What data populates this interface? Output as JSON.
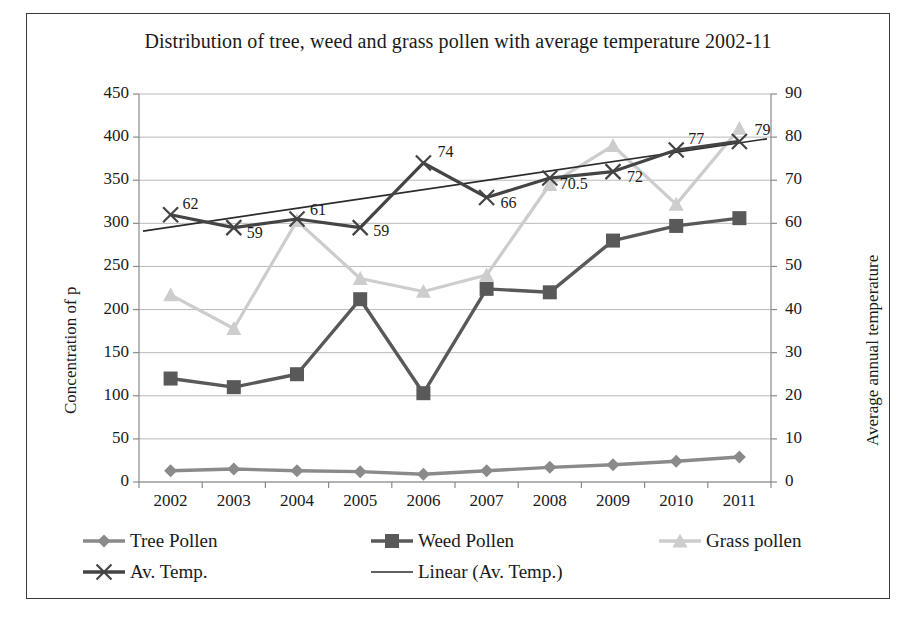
{
  "chart_data": {
    "type": "line",
    "title": "Distribution of tree, weed and grass pollen with average temperature 2002-11",
    "xlabel": "",
    "ylabel": "Concentration of p",
    "y2label": "Average annual temperature",
    "categories": [
      "2002",
      "2003",
      "2004",
      "2005",
      "2006",
      "2007",
      "2008",
      "2009",
      "2010",
      "2011"
    ],
    "ylim": [
      0,
      450
    ],
    "yticks": [
      "0",
      "50",
      "100",
      "150",
      "200",
      "250",
      "300",
      "350",
      "400",
      "450"
    ],
    "y2lim": [
      0,
      90
    ],
    "y2ticks": [
      "0",
      "10",
      "20",
      "30",
      "40",
      "50",
      "60",
      "70",
      "80",
      "90"
    ],
    "grid": true,
    "legend_position": "bottom",
    "series": [
      {
        "name": "Tree Pollen",
        "axis": "left",
        "marker": "diamond",
        "color": "#8a8a8a",
        "values": [
          13,
          15,
          13,
          12,
          9,
          13,
          17,
          20,
          24,
          29
        ]
      },
      {
        "name": "Weed Pollen",
        "axis": "left",
        "marker": "square",
        "color": "#595959",
        "values": [
          120,
          110,
          125,
          212,
          103,
          224,
          220,
          280,
          297,
          306
        ]
      },
      {
        "name": "Grass pollen",
        "axis": "left",
        "marker": "triangle",
        "color": "#cdcdcd",
        "values": [
          217,
          178,
          303,
          236,
          221,
          240,
          345,
          390,
          322,
          410
        ]
      },
      {
        "name": "Av. Temp.",
        "axis": "right",
        "marker": "x",
        "color": "#444444",
        "values": [
          62,
          59,
          61,
          59,
          74,
          66,
          70.5,
          72,
          77,
          79
        ],
        "data_labels": [
          "62",
          "59",
          "61",
          "59",
          "74",
          "66",
          "70.5",
          "72",
          "77",
          "79"
        ]
      },
      {
        "name": "Linear (Av. Temp.)",
        "axis": "right",
        "marker": "none",
        "color": "#2b2b2b",
        "trendline": true,
        "start_value": 58.2,
        "end_value": 79.6
      }
    ],
    "legend": [
      {
        "label": "Tree Pollen",
        "marker": "diamond",
        "color": "#8a8a8a"
      },
      {
        "label": "Weed Pollen",
        "marker": "square",
        "color": "#595959"
      },
      {
        "label": "Grass pollen",
        "marker": "triangle",
        "color": "#cdcdcd"
      },
      {
        "label": "Av. Temp.",
        "marker": "x",
        "color": "#444444"
      },
      {
        "label": "Linear (Av. Temp.)",
        "marker": "none",
        "color": "#2b2b2b"
      }
    ]
  }
}
